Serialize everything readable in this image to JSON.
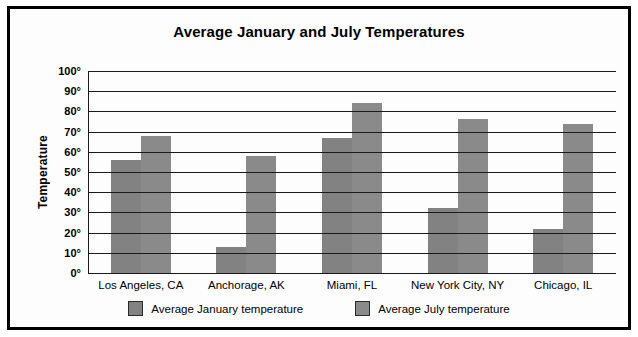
{
  "chart_data": {
    "type": "bar",
    "title": "Average January and July Temperatures",
    "xlabel": "",
    "ylabel": "Temperature",
    "categories": [
      "Los Angeles, CA",
      "Anchorage, AK",
      "Miami, FL",
      "New York City, NY",
      "Chicago, IL"
    ],
    "series": [
      {
        "name": "Average January temperature",
        "color": "#828282",
        "values": [
          56,
          13,
          67,
          32,
          22
        ]
      },
      {
        "name": "Average July temperature",
        "color": "#8a8a8a",
        "values": [
          68,
          58,
          84,
          76,
          74
        ]
      }
    ],
    "ylim": [
      0,
      100
    ],
    "ytick_step": 10,
    "ytick_labels": [
      "0°",
      "10°",
      "20°",
      "30°",
      "40°",
      "50°",
      "60°",
      "70°",
      "80°",
      "90°",
      "100°"
    ],
    "grid": true,
    "grid_axis": "y",
    "legend_position": "bottom",
    "border_color": "#000000",
    "gridline_color": "#1a1a1a",
    "background": "#fdfdfd"
  },
  "legend": {
    "items": [
      {
        "label": "Average January temperature",
        "color": "#828282"
      },
      {
        "label": "Average July temperature",
        "color": "#8a8a8a"
      }
    ]
  }
}
